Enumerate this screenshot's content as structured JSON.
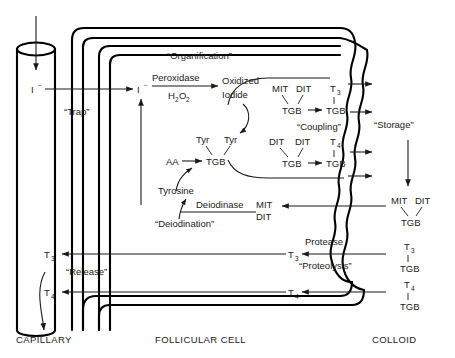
{
  "figure": {
    "zones": [
      {
        "id": "capillary",
        "label": "CAPILLARY"
      },
      {
        "id": "follicular-cell",
        "label": "FOLLICULAR CELL"
      },
      {
        "id": "colloid",
        "label": "COLLOID"
      }
    ],
    "process_labels": [
      {
        "id": "trap",
        "text": "“Trap”"
      },
      {
        "id": "organification",
        "text": "“Organification”"
      },
      {
        "id": "coupling",
        "text": "“Coupling”"
      },
      {
        "id": "storage",
        "text": "“Storage”"
      },
      {
        "id": "deiodination",
        "text": "“Deiodination”"
      },
      {
        "id": "release",
        "text": "“Release”"
      },
      {
        "id": "proteolysis",
        "text": "“Proteolysis”"
      }
    ],
    "enzymes": [
      {
        "id": "peroxidase",
        "name": "Peroxidase",
        "cofactor": "H",
        "cofactor_sub1": "2",
        "cofactor_mid": "O",
        "cofactor_sub2": "2"
      },
      {
        "id": "deiodinase",
        "name": "Deiodinase"
      },
      {
        "id": "protease",
        "name": "Protease"
      }
    ],
    "species": {
      "iodide_capillary": "I",
      "iodide_cell": "I",
      "iodide_superscript": "−",
      "oxidized_iodide_line1": "Oxidized",
      "oxidized_iodide_line2": "Iodide",
      "aa": "AA",
      "tyr_left": "Tyr",
      "tyr_right": "Tyr",
      "tgb": "TGB",
      "tyrosine": "Tyrosine",
      "mit": "MIT",
      "dit": "DIT",
      "t3": "T",
      "t3_sub": "3",
      "t4": "T",
      "t4_sub": "4"
    },
    "reactions": [
      {
        "id": "coupling-t3",
        "substrate_left": "MIT",
        "substrate_right": "DIT",
        "substrate_carrier": "TGB",
        "product": "T",
        "product_sub": "3",
        "product_carrier": "TGB"
      },
      {
        "id": "coupling-t4",
        "substrate_left": "DIT",
        "substrate_right": "DIT",
        "substrate_carrier": "TGB",
        "product": "T",
        "product_sub": "4",
        "product_carrier": "TGB"
      },
      {
        "id": "tyrosine-iodination",
        "substrate_left": "Tyr",
        "substrate_right": "Tyr",
        "substrate_carrier": "TGB",
        "source": "AA"
      }
    ],
    "colloid_stores": [
      {
        "id": "store-mitdit",
        "top_left": "MIT",
        "top_right": "DIT",
        "carrier": "TGB"
      },
      {
        "id": "store-t3",
        "top": "T",
        "top_sub": "3",
        "carrier": "TGB"
      },
      {
        "id": "store-t4",
        "top": "T",
        "top_sub": "4",
        "carrier": "TGB"
      }
    ],
    "cell_returns": [
      {
        "id": "return-mit",
        "text": "MIT"
      },
      {
        "id": "return-dit",
        "text": "DIT"
      }
    ],
    "release_products": [
      {
        "id": "release-t3",
        "text": "T",
        "sub": "3"
      },
      {
        "id": "release-t4",
        "text": "T",
        "sub": "4"
      }
    ],
    "colors": {
      "ink": "#000000",
      "text": "#1a1a1a",
      "background": "#ffffff"
    }
  }
}
